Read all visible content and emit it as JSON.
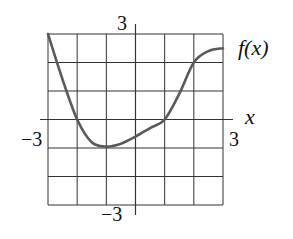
{
  "chart_data": {
    "type": "line",
    "title": "",
    "xlabel": "x",
    "ylabel": "",
    "series_label": "f(x)",
    "xlim": [
      -3,
      3
    ],
    "ylim": [
      -3,
      3
    ],
    "grid": true,
    "grid_step": 1,
    "tick_labels": {
      "x_min": "−3",
      "x_max": "3",
      "y_min": "−3",
      "y_max": "3"
    },
    "series": [
      {
        "name": "f(x)",
        "x": [
          -3,
          -2.5,
          -2,
          -1.5,
          -1,
          -0.5,
          0,
          0.5,
          1,
          1.5,
          2,
          2.5,
          3
        ],
        "y": [
          3,
          1.4,
          0,
          -0.8,
          -0.95,
          -0.85,
          -0.6,
          -0.3,
          0,
          0.9,
          2,
          2.4,
          2.5
        ]
      }
    ],
    "colors": {
      "curve": "#5a5a5a",
      "grid": "#333333",
      "axes": "#333333"
    }
  }
}
